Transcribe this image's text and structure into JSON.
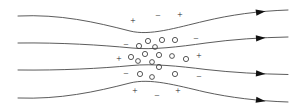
{
  "figure": {
    "background_color": "#ffffff",
    "line_color": "#4a4a4a",
    "arrow_color": "#111111",
    "circle_color": "#3a3a3a",
    "symbol_color": "#1a1a1a",
    "width": 303,
    "height": 108
  },
  "flux_lines": [
    {
      "name": "field-line-top-outer",
      "path": "M 18 16 C 60 14, 95 22, 130 31 C 150 36, 175 28, 205 21 C 230 15, 258 11, 288 10",
      "arrow": {
        "x": 256,
        "y": 12.6,
        "angle": -8
      }
    },
    {
      "name": "field-line-top-inner",
      "path": "M 18 43 C 62 42.5, 100 45, 132 48 C 152 50, 178 47, 206 43 C 232 39.5, 260 37.5, 288 37",
      "arrow": {
        "x": 256,
        "y": 38.3,
        "angle": -4
      }
    },
    {
      "name": "field-line-bottom-inner",
      "path": "M 18 70 C 62 70.5, 100 68.5, 132 65.5 C 152 63.5, 178 66, 206 69.5 C 232 72.5, 260 74, 288 74.5",
      "arrow": {
        "x": 256,
        "y": 73.4,
        "angle": 4
      }
    },
    {
      "name": "field-line-bottom-outer",
      "path": "M 18 98 C 60 99.5, 95 92, 130 83 C 150 78, 175 85, 205 92 C 230 97.5, 258 101, 288 102",
      "arrow": {
        "x": 256,
        "y": 99.8,
        "angle": 8
      }
    }
  ],
  "charge_symbols": [
    {
      "name": "charge-top-row-plus-left",
      "sign": "+",
      "x": 133,
      "y": 22
    },
    {
      "name": "charge-top-row-minus-mid",
      "sign": "−",
      "x": 158,
      "y": 17
    },
    {
      "name": "charge-top-row-plus-right",
      "sign": "+",
      "x": 180,
      "y": 16
    },
    {
      "name": "charge-row2-minus-left",
      "sign": "−",
      "x": 126,
      "y": 46
    },
    {
      "name": "charge-row2-minus-right",
      "sign": "−",
      "x": 196,
      "y": 40
    },
    {
      "name": "charge-row3-plus-left",
      "sign": "+",
      "x": 119,
      "y": 60
    },
    {
      "name": "charge-row3-plus-right",
      "sign": "+",
      "x": 199,
      "y": 57
    },
    {
      "name": "charge-row4-minus-left",
      "sign": "−",
      "x": 126,
      "y": 75
    },
    {
      "name": "charge-row4-minus-right",
      "sign": "−",
      "x": 199,
      "y": 78
    },
    {
      "name": "charge-bottom-plus-left",
      "sign": "+",
      "x": 135,
      "y": 92
    },
    {
      "name": "charge-bottom-minus-mid",
      "sign": "−",
      "x": 157,
      "y": 97
    },
    {
      "name": "charge-bottom-plus-right",
      "sign": "+",
      "x": 178,
      "y": 92
    }
  ],
  "particles": [
    {
      "name": "particle-circle",
      "cx": 148,
      "cy": 41,
      "r": 2.6
    },
    {
      "name": "particle-circle",
      "cx": 162,
      "cy": 40,
      "r": 2.6
    },
    {
      "name": "particle-circle",
      "cx": 175,
      "cy": 40,
      "r": 2.6
    },
    {
      "name": "particle-circle",
      "cx": 139,
      "cy": 46,
      "r": 2.6
    },
    {
      "name": "particle-circle",
      "cx": 155,
      "cy": 47,
      "r": 2.4
    },
    {
      "name": "particle-circle",
      "cx": 131,
      "cy": 57,
      "r": 2.6
    },
    {
      "name": "particle-circle",
      "cx": 145,
      "cy": 54,
      "r": 2.6
    },
    {
      "name": "particle-circle",
      "cx": 159,
      "cy": 55,
      "r": 2.6
    },
    {
      "name": "particle-circle",
      "cx": 172,
      "cy": 56,
      "r": 2.4
    },
    {
      "name": "particle-circle",
      "cx": 186,
      "cy": 59,
      "r": 2.6
    },
    {
      "name": "particle-circle",
      "cx": 138,
      "cy": 61,
      "r": 2.4
    },
    {
      "name": "particle-circle",
      "cx": 152,
      "cy": 62,
      "r": 2.4
    },
    {
      "name": "particle-circle",
      "cx": 159,
      "cy": 67,
      "r": 2.6
    },
    {
      "name": "particle-circle",
      "cx": 140,
      "cy": 74,
      "r": 2.6
    },
    {
      "name": "particle-circle",
      "cx": 152,
      "cy": 77,
      "r": 2.4
    },
    {
      "name": "particle-circle",
      "cx": 175,
      "cy": 74,
      "r": 2.6
    }
  ]
}
